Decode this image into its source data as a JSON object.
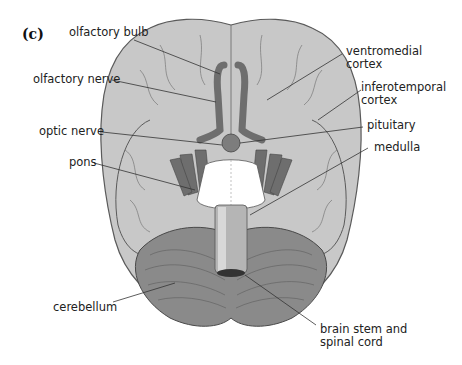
{
  "figure": {
    "panel_label": "(c)",
    "colors": {
      "cortex_fill": "#c8c8c8",
      "cortex_outline": "#5a5a5a",
      "nerve_fill": "#6e6e6e",
      "cerebellum_fill": "#8a8a8a",
      "brainstem_fill": "#ffffff",
      "label_text": "#222222",
      "leader_line": "#333333"
    }
  },
  "labels": {
    "olfactory_bulb": "olfactory bulb",
    "olfactory_nerve": "olfactory nerve",
    "optic_nerve": "optic nerve",
    "pons": "pons",
    "cerebellum": "cerebellum",
    "ventromedial_cortex": "ventromedial\ncortex",
    "inferotemporal_cortex": "inferotemporal\ncortex",
    "pituitary": "pituitary",
    "medulla": "medulla",
    "brain_stem_spinal_cord": "brain stem and\nspinal cord"
  }
}
